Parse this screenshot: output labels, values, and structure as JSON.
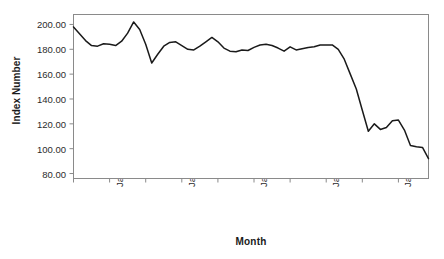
{
  "chart_data": {
    "type": "line",
    "title": "",
    "xlabel": "Month",
    "ylabel": "Index Number",
    "ylim": [
      76,
      208
    ],
    "yticks": [
      80,
      100,
      120,
      140,
      160,
      180,
      200
    ],
    "ytick_labels": [
      "80.00",
      "100.00",
      "120.00",
      "140.00",
      "160.00",
      "180.00",
      "200.00"
    ],
    "xtick_labels": [
      "Jan 2012",
      "Jan 2013",
      "Jan 2014",
      "Jan 2015",
      "Jan 2016"
    ],
    "xtick_months": [
      "2012-01",
      "2013-01",
      "2014-01",
      "2015-01",
      "2016-01"
    ],
    "grid": false,
    "legend": false,
    "line_color": "#1a1a1a",
    "frame_color": "#8a8a8a",
    "background": "#ffffff",
    "series": [
      {
        "name": "Index Number",
        "x": [
          "2011-07",
          "2011-08",
          "2011-09",
          "2011-10",
          "2011-11",
          "2011-12",
          "2012-01",
          "2012-02",
          "2012-03",
          "2012-04",
          "2012-05",
          "2012-06",
          "2012-07",
          "2012-08",
          "2012-09",
          "2012-10",
          "2012-11",
          "2012-12",
          "2013-01",
          "2013-02",
          "2013-03",
          "2013-04",
          "2013-05",
          "2013-06",
          "2013-07",
          "2013-08",
          "2013-09",
          "2013-10",
          "2013-11",
          "2013-12",
          "2014-01",
          "2014-02",
          "2014-03",
          "2014-04",
          "2014-05",
          "2014-06",
          "2014-07",
          "2014-08",
          "2014-09",
          "2014-10",
          "2014-11",
          "2014-12",
          "2015-01",
          "2015-02",
          "2015-03",
          "2015-04",
          "2015-05",
          "2015-06",
          "2015-07",
          "2015-08",
          "2015-09",
          "2015-10",
          "2015-11",
          "2015-12",
          "2016-01",
          "2016-02",
          "2016-03",
          "2016-04",
          "2016-05",
          "2016-06"
        ],
        "values": [
          198.0,
          192.5,
          187.0,
          183.0,
          182.5,
          184.5,
          184.0,
          183.0,
          186.5,
          193.0,
          202.0,
          196.0,
          184.0,
          169.0,
          176.0,
          182.5,
          185.5,
          186.0,
          183.0,
          180.0,
          179.5,
          182.5,
          186.0,
          189.5,
          186.0,
          181.0,
          178.5,
          178.0,
          179.5,
          179.0,
          181.5,
          183.5,
          184.0,
          183.0,
          181.0,
          178.5,
          182.0,
          179.5,
          180.5,
          181.5,
          182.0,
          183.5,
          183.5,
          183.5,
          180.0,
          172.0,
          160.0,
          148.0,
          131.0,
          114.0,
          120.0,
          115.5,
          117.0,
          122.5,
          123.0,
          115.0,
          102.5,
          101.5,
          101.0,
          92.0
        ]
      }
    ],
    "annotations": {
      "trough_value": 82.0,
      "trough_month": "2016-02",
      "end_value": 104.0,
      "peak_value": 202.0,
      "peak_month": "2012-05"
    }
  },
  "axes": {
    "y_title": "Index Number",
    "x_title": "Month"
  }
}
